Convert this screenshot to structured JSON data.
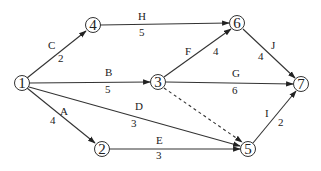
{
  "diagram": {
    "type": "activity-network",
    "colors": {
      "stroke": "#333333",
      "background": "#ffffff",
      "text": "#222222"
    },
    "nodes": [
      {
        "id": "1",
        "label": "1",
        "x": 22,
        "y": 83
      },
      {
        "id": "2",
        "label": "2",
        "x": 102,
        "y": 149
      },
      {
        "id": "3",
        "label": "3",
        "x": 158,
        "y": 82
      },
      {
        "id": "4",
        "label": "4",
        "x": 93,
        "y": 25
      },
      {
        "id": "5",
        "label": "5",
        "x": 248,
        "y": 149
      },
      {
        "id": "6",
        "label": "6",
        "x": 237,
        "y": 23
      },
      {
        "id": "7",
        "label": "7",
        "x": 301,
        "y": 84
      }
    ],
    "edges": [
      {
        "from": "1",
        "to": "4",
        "activity": "C",
        "duration": "2",
        "dashed": false
      },
      {
        "from": "1",
        "to": "3",
        "activity": "B",
        "duration": "5",
        "dashed": false
      },
      {
        "from": "1",
        "to": "5",
        "activity": "D",
        "duration": "3",
        "dashed": false
      },
      {
        "from": "1",
        "to": "2",
        "activity": "A",
        "duration": "4",
        "dashed": false
      },
      {
        "from": "4",
        "to": "6",
        "activity": "H",
        "duration": "5",
        "dashed": false
      },
      {
        "from": "3",
        "to": "6",
        "activity": "F",
        "duration": "4",
        "dashed": false
      },
      {
        "from": "3",
        "to": "7",
        "activity": "G",
        "duration": "6",
        "dashed": false
      },
      {
        "from": "3",
        "to": "5",
        "activity": "",
        "duration": "",
        "dashed": true
      },
      {
        "from": "2",
        "to": "5",
        "activity": "E",
        "duration": "3",
        "dashed": false
      },
      {
        "from": "6",
        "to": "7",
        "activity": "J",
        "duration": "4",
        "dashed": false
      },
      {
        "from": "5",
        "to": "7",
        "activity": "I",
        "duration": "2",
        "dashed": false
      }
    ]
  }
}
